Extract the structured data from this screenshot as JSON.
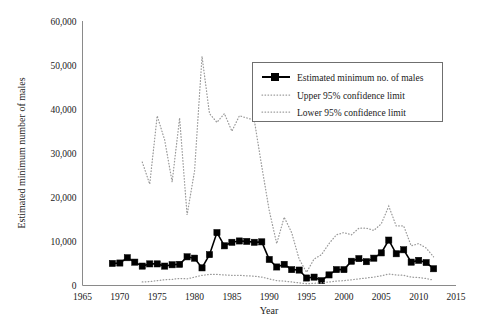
{
  "chart_data": {
    "type": "line",
    "title": "",
    "xlabel": "Year",
    "ylabel": "Estimated minimum number of males",
    "xlim": [
      1965,
      2015
    ],
    "ylim": [
      0,
      60000
    ],
    "xticks": [
      "1965",
      "1970",
      "1975",
      "1980",
      "1985",
      "1990",
      "1995",
      "2000",
      "2005",
      "2010",
      "2015"
    ],
    "yticks": [
      "0",
      "10,000",
      "20,000",
      "30,000",
      "40,000",
      "50,000",
      "60,000"
    ],
    "grid": false,
    "legend_position": "top-right",
    "series": [
      {
        "name": "Estimated minimum no. of males",
        "style": "solid-with-square-markers",
        "color": "#000000",
        "x": [
          1969,
          1970,
          1971,
          1972,
          1973,
          1974,
          1975,
          1976,
          1977,
          1978,
          1979,
          1980,
          1981,
          1982,
          1983,
          1984,
          1985,
          1986,
          1987,
          1988,
          1989,
          1990,
          1991,
          1992,
          1993,
          1994,
          1995,
          1996,
          1997,
          1998,
          1999,
          2000,
          2001,
          2002,
          2003,
          2004,
          2005,
          2006,
          2007,
          2008,
          2009,
          2010,
          2011,
          2012
        ],
        "values": [
          5000,
          5100,
          6300,
          5300,
          4400,
          4900,
          4900,
          4400,
          4700,
          4800,
          6500,
          6200,
          4000,
          7000,
          12000,
          9000,
          9800,
          10100,
          10000,
          9800,
          9900,
          5900,
          4200,
          4800,
          3600,
          3500,
          1700,
          1900,
          1100,
          2400,
          3600,
          3600,
          5500,
          6100,
          5400,
          6200,
          7400,
          10300,
          7200,
          8100,
          5300,
          5700,
          5200,
          3800
        ]
      },
      {
        "name": "Upper 95% confidence limit",
        "style": "dotted",
        "color": "#9a9a9a",
        "x": [
          1973,
          1974,
          1975,
          1976,
          1977,
          1978,
          1979,
          1980,
          1981,
          1982,
          1983,
          1984,
          1985,
          1986,
          1987,
          1988,
          1989,
          1990,
          1991,
          1992,
          1993,
          1994,
          1995,
          1996,
          1997,
          1998,
          1999,
          2000,
          2001,
          2002,
          2003,
          2004,
          2005,
          2006,
          2007,
          2008,
          2009,
          2010,
          2011,
          2012
        ],
        "values": [
          28000,
          23000,
          38500,
          33000,
          23500,
          38000,
          16000,
          26000,
          52000,
          39000,
          37000,
          39000,
          35000,
          38500,
          38000,
          37500,
          27000,
          17000,
          9500,
          15500,
          12000,
          6000,
          3000,
          6000,
          7000,
          9500,
          11500,
          12000,
          11500,
          13000,
          13000,
          12500,
          14000,
          18000,
          13500,
          13500,
          9000,
          9500,
          8500,
          6500
        ]
      },
      {
        "name": "Lower 95% confidence limit",
        "style": "dotted",
        "color": "#9a9a9a",
        "x": [
          1973,
          1974,
          1975,
          1976,
          1977,
          1978,
          1979,
          1980,
          1981,
          1982,
          1983,
          1984,
          1985,
          1986,
          1987,
          1988,
          1989,
          1990,
          1991,
          1992,
          1993,
          1994,
          1995,
          1996,
          1997,
          1998,
          1999,
          2000,
          2001,
          2002,
          2003,
          2004,
          2005,
          2006,
          2007,
          2008,
          2009,
          2010,
          2011,
          2012
        ],
        "values": [
          800,
          900,
          1100,
          1300,
          1400,
          1600,
          1500,
          1900,
          2300,
          2500,
          2500,
          2400,
          2300,
          2300,
          2200,
          2100,
          1900,
          1500,
          1100,
          1000,
          800,
          600,
          400,
          500,
          600,
          800,
          1000,
          1100,
          1300,
          1500,
          1700,
          1900,
          2200,
          2600,
          2400,
          2300,
          1900,
          1800,
          1600,
          1200
        ]
      }
    ]
  },
  "legend": {
    "items": [
      {
        "label": "Estimated minimum no. of males",
        "marker": "line-square"
      },
      {
        "label": "Upper 95% confidence limit",
        "marker": "dotted-line"
      },
      {
        "label": "Lower 95% confidence limit",
        "marker": "dotted-line"
      }
    ]
  }
}
